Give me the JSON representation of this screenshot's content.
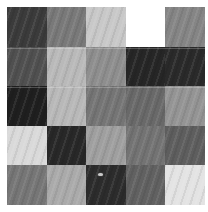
{
  "figure": {
    "kind": "grayscale-tile-grid",
    "rows": 5,
    "cols": 5,
    "background_color": "#ffffff",
    "margin_px": 7,
    "tile_size_px": 40,
    "texture": "faint-diagonal-stripes"
  },
  "chart_data": {
    "type": "heatmap",
    "title": "",
    "subtitle": "",
    "xlabel": "",
    "ylabel": "",
    "grid": false,
    "legend": "none",
    "colormap": "grayscale",
    "rows": 5,
    "cols": 5,
    "x": [
      "1",
      "2",
      "3",
      "4",
      "5"
    ],
    "y": [
      "1",
      "2",
      "3",
      "4",
      "5"
    ],
    "xticklabels": [],
    "yticklabels": [],
    "values": [
      [
        0.23,
        0.47,
        0.78,
        null,
        0.52
      ],
      [
        0.31,
        0.72,
        0.55,
        0.14,
        0.16
      ],
      [
        0.12,
        0.72,
        0.45,
        0.4,
        0.58
      ],
      [
        0.85,
        0.15,
        0.62,
        0.44,
        0.36
      ],
      [
        0.46,
        0.66,
        0.17,
        0.38,
        0.9
      ]
    ],
    "colors": [
      [
        "#3b3b3b",
        "#797979",
        "#c8c8c8",
        "#ffffff",
        "#858585"
      ],
      [
        "#505050",
        "#b9b9b9",
        "#8e8e8e",
        "#262626",
        "#2a2a2a"
      ],
      [
        "#1f1f1f",
        "#b8b8b8",
        "#757575",
        "#696969",
        "#949494"
      ],
      [
        "#d9d9d9",
        "#282828",
        "#9f9f9f",
        "#737373",
        "#5e5e5e"
      ],
      [
        "#767676",
        "#aaaaaa",
        "#2c2c2c",
        "#616161",
        "#e3e3e3"
      ]
    ],
    "annotations": [
      {
        "name": "speck-artifact",
        "row": 5,
        "col": 3,
        "offset_x_px": 12,
        "offset_y_px": 8,
        "color": "#c9c9c9"
      }
    ],
    "blank_cells": [
      {
        "row": 1,
        "col": 4
      }
    ]
  }
}
